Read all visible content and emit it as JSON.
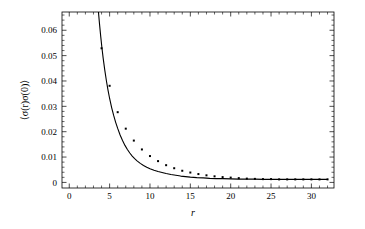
{
  "figure": {
    "background_color": "#ffffff",
    "foreground_color": "#000000"
  },
  "chart_data": {
    "type": "scatter",
    "title": "",
    "subtitle": "",
    "xlabel": "r",
    "ylabel": "⟨σ(r)σ(0)⟩",
    "xlim": [
      -0.9,
      32.8
    ],
    "ylim": [
      -0.0022,
      0.0672
    ],
    "xticks": [
      0,
      5,
      10,
      15,
      20,
      25,
      30
    ],
    "xtick_labels": [
      "0",
      "5",
      "10",
      "15",
      "20",
      "25",
      "30"
    ],
    "xtick_minor_step": 1,
    "yticks": [
      0,
      0.01,
      0.02,
      0.03,
      0.04,
      0.05,
      0.06
    ],
    "ytick_labels": [
      "0",
      "0.01",
      "0.02",
      "0.03",
      "0.04",
      "0.05",
      "0.06"
    ],
    "ytick_minor_step": 0.002,
    "grid": false,
    "legend": null,
    "legend_position": "none",
    "series": [
      {
        "name": "correlator",
        "marker": "square",
        "marker_size": 2.0,
        "line": true,
        "color": "#000000",
        "x": [
          4,
          5,
          6,
          7,
          8,
          9,
          10,
          11,
          12,
          13,
          14,
          15,
          16,
          17,
          18,
          19,
          20,
          21,
          22,
          23,
          24,
          25,
          26,
          27,
          28,
          29,
          30,
          31,
          32
        ],
        "y": [
          0.0529,
          0.0381,
          0.0277,
          0.0212,
          0.0165,
          0.013,
          0.0104,
          0.0084,
          0.0068,
          0.0056,
          0.0046,
          0.0039,
          0.0033,
          0.0028,
          0.0024,
          0.0021,
          0.0019,
          0.0017,
          0.0015,
          0.0014,
          0.0013,
          0.0013,
          0.0012,
          0.0012,
          0.0012,
          0.0012,
          0.0012,
          0.0012,
          0.0012
        ]
      }
    ],
    "fit_curve": {
      "name": "fit",
      "color": "#000000",
      "x": [
        3.0,
        3.15,
        3.3,
        3.45,
        3.6,
        3.75,
        3.9,
        4.05,
        4.2,
        4.4,
        4.6,
        4.8,
        5.0,
        5.25,
        5.5,
        5.75,
        6.0,
        6.3,
        6.6,
        6.9,
        7.2,
        7.5,
        7.8,
        8.1,
        8.4,
        8.8,
        9.2,
        9.6,
        10.0,
        10.5,
        11.0,
        11.5,
        12.0,
        12.6,
        13.2,
        13.8,
        14.4,
        15.0,
        15.8,
        16.6,
        17.4,
        18.2,
        19.0,
        20.0,
        21.0,
        22.0,
        23.0,
        24.0,
        25.0,
        26.0,
        27.0,
        28.0,
        29.0,
        30.0,
        31.0,
        32.0
      ],
      "y": [
        0.096,
        0.0878,
        0.0804,
        0.0738,
        0.0678,
        0.0624,
        0.0575,
        0.053,
        0.049,
        0.0443,
        0.0401,
        0.0364,
        0.0331,
        0.0295,
        0.0264,
        0.0237,
        0.0213,
        0.0187,
        0.0165,
        0.0146,
        0.013,
        0.0116,
        0.0104,
        0.0094,
        0.0085,
        0.0075,
        0.0067,
        0.006,
        0.0054,
        0.0048,
        0.0043,
        0.0039,
        0.0035,
        0.0031,
        0.0028,
        0.0025,
        0.0023,
        0.0021,
        0.0019,
        0.0018,
        0.0016,
        0.0015,
        0.0015,
        0.0014,
        0.0013,
        0.0013,
        0.0013,
        0.0012,
        0.0012,
        0.0012,
        0.0012,
        0.0012,
        0.0012,
        0.0012,
        0.0012,
        0.0012
      ]
    }
  }
}
